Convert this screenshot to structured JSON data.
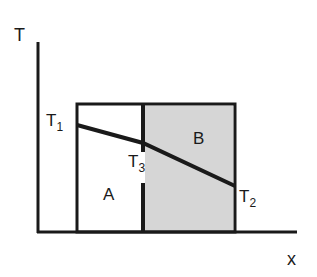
{
  "axes": {
    "y_label": "T",
    "x_label": "x"
  },
  "regions": {
    "left": "A",
    "right": "B"
  },
  "temperatures": {
    "t1": {
      "base": "T",
      "sub": "1"
    },
    "t2": {
      "base": "T",
      "sub": "2"
    },
    "t3": {
      "base": "T",
      "sub": "3"
    }
  },
  "colors": {
    "line": "#1a1a1a",
    "shade": "#d4d4d4"
  }
}
